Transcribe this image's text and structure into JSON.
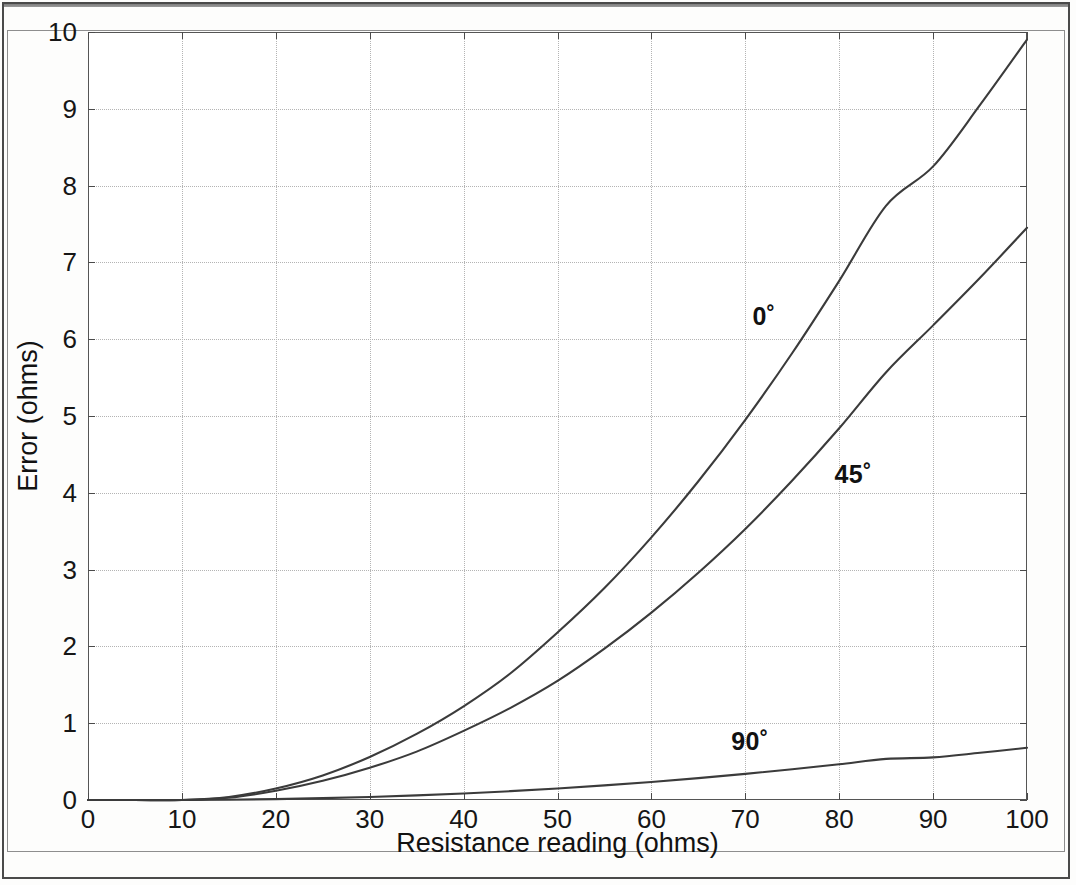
{
  "figure": {
    "frame_style": "double-rule scanned page border",
    "background": "#ffffff"
  },
  "chart_data": {
    "type": "line",
    "title": "",
    "xlabel": "Resistance reading (ohms)",
    "ylabel": "Error (ohms)",
    "xlim": [
      0,
      100
    ],
    "ylim": [
      0,
      10
    ],
    "xticks": [
      0,
      10,
      20,
      30,
      40,
      50,
      60,
      70,
      80,
      90,
      100
    ],
    "xticklabels": [
      "0",
      "10",
      "20",
      "30",
      "40",
      "50",
      "60",
      "70",
      "80",
      "90",
      "100"
    ],
    "yticks": [
      0,
      1,
      2,
      3,
      4,
      5,
      6,
      7,
      8,
      9,
      10
    ],
    "yticklabels": [
      "0",
      "1",
      "2",
      "3",
      "4",
      "5",
      "6",
      "7",
      "8",
      "9",
      "10"
    ],
    "grid": true,
    "grid_style": "dotted",
    "grid_color": "#b4b4b4",
    "legend": "inline annotations",
    "line_color": "#3b3b3b",
    "x": [
      0,
      5,
      10,
      15,
      20,
      25,
      30,
      35,
      40,
      45,
      50,
      55,
      60,
      65,
      70,
      75,
      80,
      85,
      90,
      95,
      100
    ],
    "series": [
      {
        "name": "0˚",
        "label": "0˚",
        "label_x": 72,
        "label_y": 6.3,
        "values": [
          0,
          0,
          0,
          0.04,
          0.15,
          0.32,
          0.56,
          0.86,
          1.22,
          1.65,
          2.18,
          2.76,
          3.42,
          4.15,
          4.95,
          5.82,
          6.76,
          7.74,
          8.25,
          9.05,
          9.9
        ]
      },
      {
        "name": "45˚",
        "label": "45˚",
        "label_x": 81.5,
        "label_y": 4.25,
        "values": [
          0,
          0,
          0,
          0.03,
          0.12,
          0.25,
          0.42,
          0.63,
          0.9,
          1.2,
          1.55,
          1.97,
          2.44,
          2.96,
          3.53,
          4.16,
          4.84,
          5.57,
          6.18,
          6.8,
          7.45
        ]
      },
      {
        "name": "90˚",
        "label": "90˚",
        "label_x": 70.5,
        "label_y": 0.77,
        "values": [
          0,
          0,
          0,
          0.004,
          0.012,
          0.024,
          0.04,
          0.06,
          0.085,
          0.115,
          0.15,
          0.19,
          0.235,
          0.285,
          0.34,
          0.4,
          0.465,
          0.535,
          0.555,
          0.615,
          0.68
        ]
      }
    ]
  }
}
